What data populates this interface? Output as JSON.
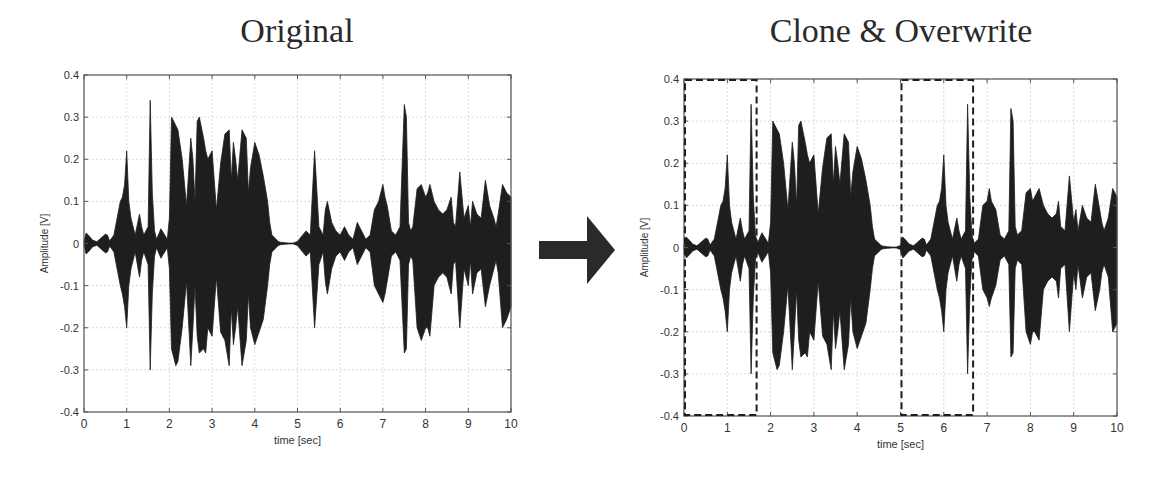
{
  "figure": {
    "arrow_label": "arrow-right",
    "colors": {
      "waveform": "#1e1e1e",
      "axes": "#555555",
      "grid": "#d9d9d9",
      "dashed_box": "#1e1e1e",
      "arrow": "#2a2a2a"
    }
  },
  "chart_data": [
    {
      "type": "area",
      "title": "Original",
      "xlabel": "time [sec]",
      "ylabel": "Amplitude [V]",
      "xlim": [
        0,
        10
      ],
      "ylim": [
        -0.4,
        0.4
      ],
      "xticks": [
        "0",
        "1",
        "2",
        "3",
        "4",
        "5",
        "6",
        "7",
        "8",
        "9",
        "10"
      ],
      "yticks": [
        "0.4",
        "0.3",
        "0.2",
        "0.1",
        "0",
        "-0.1",
        "-0.2",
        "-0.3",
        "-0.4"
      ],
      "grid": true,
      "series": [
        {
          "name": "waveform envelope",
          "x": [
            0.0,
            0.05,
            0.1,
            0.2,
            0.3,
            0.5,
            0.55,
            0.6,
            0.7,
            0.85,
            0.9,
            0.95,
            1.0,
            1.05,
            1.1,
            1.2,
            1.3,
            1.35,
            1.4,
            1.5,
            1.55,
            1.6,
            1.65,
            1.7,
            1.8,
            1.95,
            2.0,
            2.05,
            2.1,
            2.15,
            2.2,
            2.3,
            2.4,
            2.5,
            2.55,
            2.6,
            2.65,
            2.7,
            2.8,
            2.85,
            2.9,
            3.0,
            3.1,
            3.2,
            3.3,
            3.4,
            3.45,
            3.5,
            3.55,
            3.6,
            3.7,
            3.8,
            3.85,
            3.9,
            4.0,
            4.1,
            4.2,
            4.3,
            4.35,
            4.4,
            4.5,
            4.55,
            4.6,
            4.7,
            4.8,
            4.9,
            5.0,
            5.2,
            5.3,
            5.4,
            5.5,
            5.6,
            5.65,
            5.7,
            5.8,
            5.9,
            6.0,
            6.1,
            6.2,
            6.3,
            6.4,
            6.45,
            6.5,
            6.6,
            6.7,
            6.8,
            6.9,
            7.0,
            7.05,
            7.1,
            7.2,
            7.3,
            7.4,
            7.5,
            7.55,
            7.6,
            7.65,
            7.7,
            7.8,
            7.9,
            8.0,
            8.05,
            8.1,
            8.2,
            8.3,
            8.4,
            8.5,
            8.6,
            8.65,
            8.7,
            8.8,
            8.9,
            9.0,
            9.05,
            9.1,
            9.2,
            9.3,
            9.4,
            9.5,
            9.6,
            9.65,
            9.7,
            9.8,
            9.9,
            10.0
          ],
          "upper": [
            0.005,
            0.025,
            0.02,
            0.008,
            0.004,
            0.022,
            0.02,
            0.006,
            0.02,
            0.1,
            0.11,
            0.14,
            0.22,
            0.1,
            0.06,
            0.02,
            0.07,
            0.04,
            0.02,
            0.04,
            0.34,
            0.12,
            0.03,
            0.01,
            0.035,
            0.01,
            0.06,
            0.3,
            0.29,
            0.28,
            0.27,
            0.2,
            0.09,
            0.25,
            0.2,
            0.1,
            0.29,
            0.3,
            0.25,
            0.22,
            0.2,
            0.22,
            0.08,
            0.19,
            0.26,
            0.27,
            0.15,
            0.24,
            0.2,
            0.15,
            0.27,
            0.25,
            0.12,
            0.18,
            0.24,
            0.21,
            0.16,
            0.1,
            0.05,
            0.02,
            0.01,
            0.005,
            0.003,
            0.002,
            0.001,
            0.001,
            0.005,
            0.03,
            0.02,
            0.22,
            0.04,
            0.02,
            0.08,
            0.1,
            0.05,
            0.03,
            0.02,
            0.04,
            0.02,
            0.01,
            0.05,
            0.04,
            0.03,
            0.01,
            0.02,
            0.08,
            0.1,
            0.14,
            0.11,
            0.09,
            0.03,
            0.02,
            0.04,
            0.33,
            0.3,
            0.05,
            0.03,
            0.04,
            0.13,
            0.14,
            0.11,
            0.12,
            0.14,
            0.1,
            0.08,
            0.07,
            0.08,
            0.11,
            0.05,
            0.04,
            0.17,
            0.06,
            0.09,
            0.04,
            0.1,
            0.07,
            0.06,
            0.15,
            0.09,
            0.06,
            0.04,
            0.07,
            0.14,
            0.12,
            0.11,
            0.09,
            0.01
          ],
          "lower": [
            -0.005,
            -0.025,
            -0.02,
            -0.008,
            -0.004,
            -0.022,
            -0.02,
            -0.006,
            -0.02,
            -0.1,
            -0.12,
            -0.15,
            -0.2,
            -0.1,
            -0.06,
            -0.02,
            -0.08,
            -0.04,
            -0.02,
            -0.05,
            -0.3,
            -0.12,
            -0.03,
            -0.01,
            -0.035,
            -0.01,
            -0.06,
            -0.25,
            -0.27,
            -0.29,
            -0.28,
            -0.2,
            -0.09,
            -0.29,
            -0.2,
            -0.1,
            -0.22,
            -0.26,
            -0.25,
            -0.26,
            -0.2,
            -0.22,
            -0.08,
            -0.21,
            -0.23,
            -0.29,
            -0.15,
            -0.24,
            -0.2,
            -0.15,
            -0.29,
            -0.23,
            -0.12,
            -0.2,
            -0.24,
            -0.21,
            -0.18,
            -0.1,
            -0.05,
            -0.02,
            -0.01,
            -0.005,
            -0.003,
            -0.002,
            -0.001,
            -0.001,
            -0.005,
            -0.03,
            -0.02,
            -0.2,
            -0.05,
            -0.02,
            -0.09,
            -0.12,
            -0.06,
            -0.03,
            -0.02,
            -0.04,
            -0.02,
            -0.01,
            -0.05,
            -0.04,
            -0.03,
            -0.01,
            -0.02,
            -0.1,
            -0.12,
            -0.14,
            -0.12,
            -0.09,
            -0.03,
            -0.02,
            -0.04,
            -0.26,
            -0.25,
            -0.05,
            -0.03,
            -0.04,
            -0.2,
            -0.23,
            -0.2,
            -0.2,
            -0.22,
            -0.1,
            -0.08,
            -0.07,
            -0.08,
            -0.12,
            -0.05,
            -0.04,
            -0.2,
            -0.06,
            -0.1,
            -0.04,
            -0.12,
            -0.07,
            -0.06,
            -0.15,
            -0.1,
            -0.06,
            -0.04,
            -0.07,
            -0.2,
            -0.18,
            -0.15,
            -0.1,
            -0.01
          ]
        }
      ]
    },
    {
      "type": "area",
      "title": "Clone & Overwrite",
      "xlabel": "time [sec]",
      "ylabel": "Amplitude [V]",
      "xlim": [
        0,
        10
      ],
      "ylim": [
        -0.4,
        0.4
      ],
      "xticks": [
        "0",
        "1",
        "2",
        "3",
        "4",
        "5",
        "6",
        "7",
        "8",
        "9",
        "10"
      ],
      "yticks": [
        "0.4",
        "0.3",
        "0.2",
        "0.1",
        "0",
        "-0.1",
        "-0.2",
        "-0.3",
        "-0.4"
      ],
      "grid": true,
      "annotations": [
        {
          "type": "dashed-box",
          "label": "cloned-region",
          "x0": 0.0,
          "x1": 1.7,
          "y0": -0.4,
          "y1": 0.4
        },
        {
          "type": "dashed-box",
          "label": "overwritten-region",
          "x0": 5.0,
          "x1": 6.7,
          "y0": -0.4,
          "y1": 0.4
        }
      ],
      "series": [
        {
          "name": "waveform envelope",
          "x": [
            0.0,
            0.05,
            0.1,
            0.2,
            0.3,
            0.5,
            0.55,
            0.6,
            0.7,
            0.85,
            0.9,
            0.95,
            1.0,
            1.05,
            1.1,
            1.2,
            1.3,
            1.35,
            1.4,
            1.5,
            1.55,
            1.6,
            1.65,
            1.7,
            1.8,
            1.95,
            2.0,
            2.05,
            2.1,
            2.15,
            2.2,
            2.3,
            2.4,
            2.5,
            2.55,
            2.6,
            2.65,
            2.7,
            2.8,
            2.85,
            2.9,
            3.0,
            3.1,
            3.2,
            3.3,
            3.4,
            3.45,
            3.5,
            3.55,
            3.6,
            3.7,
            3.8,
            3.85,
            3.9,
            4.0,
            4.1,
            4.2,
            4.3,
            4.35,
            4.4,
            4.5,
            4.55,
            4.6,
            4.7,
            4.8,
            4.9,
            5.0,
            5.05,
            5.1,
            5.2,
            5.3,
            5.5,
            5.55,
            5.6,
            5.7,
            5.85,
            5.9,
            5.95,
            6.0,
            6.05,
            6.1,
            6.2,
            6.3,
            6.35,
            6.4,
            6.5,
            6.55,
            6.6,
            6.65,
            6.7,
            6.8,
            6.9,
            7.0,
            7.05,
            7.1,
            7.2,
            7.3,
            7.4,
            7.5,
            7.55,
            7.6,
            7.65,
            7.7,
            7.8,
            7.9,
            8.0,
            8.05,
            8.1,
            8.2,
            8.3,
            8.4,
            8.5,
            8.6,
            8.65,
            8.7,
            8.8,
            8.9,
            9.0,
            9.05,
            9.1,
            9.2,
            9.3,
            9.4,
            9.5,
            9.6,
            9.65,
            9.7,
            9.8,
            9.9,
            10.0
          ],
          "upper": [
            0.005,
            0.025,
            0.02,
            0.008,
            0.004,
            0.022,
            0.02,
            0.006,
            0.02,
            0.1,
            0.11,
            0.14,
            0.22,
            0.1,
            0.06,
            0.02,
            0.07,
            0.04,
            0.02,
            0.04,
            0.34,
            0.12,
            0.03,
            0.01,
            0.035,
            0.01,
            0.06,
            0.3,
            0.29,
            0.28,
            0.27,
            0.2,
            0.09,
            0.25,
            0.2,
            0.1,
            0.29,
            0.3,
            0.25,
            0.22,
            0.2,
            0.22,
            0.08,
            0.19,
            0.26,
            0.27,
            0.15,
            0.24,
            0.2,
            0.15,
            0.27,
            0.25,
            0.12,
            0.18,
            0.24,
            0.21,
            0.16,
            0.1,
            0.05,
            0.02,
            0.01,
            0.005,
            0.003,
            0.002,
            0.001,
            0.001,
            0.005,
            0.025,
            0.02,
            0.008,
            0.004,
            0.022,
            0.02,
            0.006,
            0.02,
            0.1,
            0.11,
            0.14,
            0.22,
            0.1,
            0.06,
            0.02,
            0.07,
            0.04,
            0.02,
            0.04,
            0.34,
            0.12,
            0.03,
            0.01,
            0.02,
            0.1,
            0.11,
            0.14,
            0.11,
            0.09,
            0.03,
            0.02,
            0.04,
            0.33,
            0.3,
            0.05,
            0.03,
            0.04,
            0.13,
            0.14,
            0.11,
            0.12,
            0.14,
            0.1,
            0.08,
            0.07,
            0.08,
            0.11,
            0.05,
            0.04,
            0.17,
            0.06,
            0.09,
            0.04,
            0.1,
            0.07,
            0.06,
            0.15,
            0.09,
            0.06,
            0.04,
            0.07,
            0.14,
            0.12,
            0.11,
            0.09,
            0.01
          ],
          "lower": [
            -0.005,
            -0.025,
            -0.02,
            -0.008,
            -0.004,
            -0.022,
            -0.02,
            -0.006,
            -0.02,
            -0.1,
            -0.12,
            -0.15,
            -0.2,
            -0.1,
            -0.06,
            -0.02,
            -0.08,
            -0.04,
            -0.02,
            -0.05,
            -0.3,
            -0.12,
            -0.03,
            -0.01,
            -0.035,
            -0.01,
            -0.06,
            -0.25,
            -0.27,
            -0.29,
            -0.28,
            -0.2,
            -0.09,
            -0.29,
            -0.2,
            -0.1,
            -0.22,
            -0.26,
            -0.25,
            -0.26,
            -0.2,
            -0.22,
            -0.08,
            -0.21,
            -0.23,
            -0.29,
            -0.15,
            -0.24,
            -0.2,
            -0.15,
            -0.29,
            -0.23,
            -0.12,
            -0.2,
            -0.24,
            -0.21,
            -0.18,
            -0.1,
            -0.05,
            -0.02,
            -0.01,
            -0.005,
            -0.003,
            -0.002,
            -0.001,
            -0.001,
            -0.005,
            -0.025,
            -0.02,
            -0.008,
            -0.004,
            -0.022,
            -0.02,
            -0.006,
            -0.02,
            -0.1,
            -0.12,
            -0.15,
            -0.2,
            -0.1,
            -0.06,
            -0.02,
            -0.08,
            -0.04,
            -0.02,
            -0.05,
            -0.3,
            -0.12,
            -0.03,
            -0.01,
            -0.02,
            -0.1,
            -0.12,
            -0.14,
            -0.12,
            -0.09,
            -0.03,
            -0.02,
            -0.04,
            -0.26,
            -0.25,
            -0.05,
            -0.03,
            -0.04,
            -0.2,
            -0.23,
            -0.2,
            -0.2,
            -0.22,
            -0.1,
            -0.08,
            -0.07,
            -0.08,
            -0.12,
            -0.05,
            -0.04,
            -0.2,
            -0.06,
            -0.1,
            -0.04,
            -0.12,
            -0.07,
            -0.06,
            -0.15,
            -0.1,
            -0.06,
            -0.04,
            -0.07,
            -0.2,
            -0.18,
            -0.15,
            -0.1,
            -0.01
          ]
        }
      ]
    }
  ]
}
